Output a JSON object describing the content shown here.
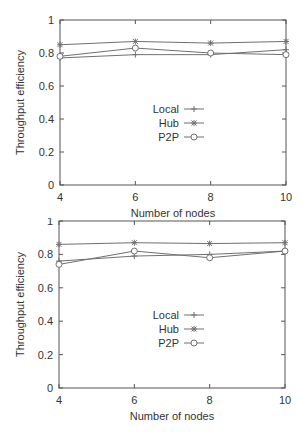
{
  "chart_data": [
    {
      "type": "line",
      "title": "",
      "xlabel": "Number of nodes",
      "ylabel": "Throughput efficiency",
      "x": [
        4,
        6,
        8,
        10
      ],
      "xticks": [
        "4",
        "6",
        "8",
        "10"
      ],
      "yticks": [
        "0",
        "0.2",
        "0.4",
        "0.6",
        "0.8",
        "1"
      ],
      "xlim": [
        4,
        10
      ],
      "ylim": [
        0,
        1
      ],
      "grid": false,
      "legend_position": "center",
      "series": [
        {
          "name": "Local",
          "marker": "plus",
          "values": [
            0.77,
            0.79,
            0.79,
            0.82
          ]
        },
        {
          "name": "Hub",
          "marker": "star",
          "values": [
            0.85,
            0.87,
            0.86,
            0.87
          ]
        },
        {
          "name": "P2P",
          "marker": "circle",
          "values": [
            0.78,
            0.83,
            0.8,
            0.79
          ]
        }
      ]
    },
    {
      "type": "line",
      "title": "",
      "xlabel": "Number of nodes",
      "ylabel": "Throughput efficiency",
      "x": [
        4,
        6,
        8,
        10
      ],
      "xticks": [
        "4",
        "6",
        "8",
        "10"
      ],
      "yticks": [
        "0",
        "0.2",
        "0.4",
        "0.6",
        "0.8",
        "1"
      ],
      "xlim": [
        4,
        10
      ],
      "ylim": [
        0,
        1
      ],
      "grid": false,
      "legend_position": "center",
      "series": [
        {
          "name": "Local",
          "marker": "plus",
          "values": [
            0.76,
            0.79,
            0.8,
            0.82
          ]
        },
        {
          "name": "Hub",
          "marker": "star",
          "values": [
            0.86,
            0.87,
            0.865,
            0.87
          ]
        },
        {
          "name": "P2P",
          "marker": "circle",
          "values": [
            0.74,
            0.82,
            0.78,
            0.82
          ]
        }
      ]
    }
  ],
  "style": {
    "line_color": "#707070",
    "axis_color": "#555555",
    "text_color": "#333333"
  }
}
